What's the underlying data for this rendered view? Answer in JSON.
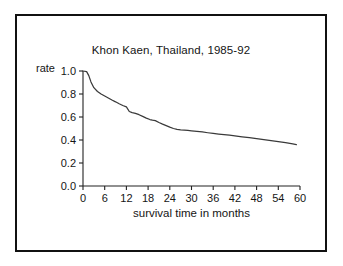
{
  "figure": {
    "border_color": "#111111",
    "background": "#ffffff"
  },
  "chart_data": {
    "type": "line",
    "title": "Khon Kaen, Thailand, 1985-92",
    "xlabel": "survival time in months",
    "ylabel": "rate",
    "xlim": [
      0,
      60
    ],
    "ylim": [
      0.0,
      1.0
    ],
    "grid": false,
    "legend": null,
    "line_color": "#3a3a3a",
    "xticks": [
      0,
      6,
      12,
      18,
      24,
      30,
      36,
      42,
      48,
      54,
      60
    ],
    "xtick_labels": [
      "0",
      "6",
      "12",
      "18",
      "24",
      "30",
      "36",
      "42",
      "48",
      "54",
      "60"
    ],
    "yticks": [
      0.0,
      0.2,
      0.4,
      0.6,
      0.8,
      1.0
    ],
    "ytick_labels": [
      "0.0",
      "0.2",
      "0.4",
      "0.6",
      "0.8",
      "1.0"
    ],
    "series": [
      {
        "name": "survival rate",
        "x": [
          0,
          1,
          1.6,
          2.2,
          3,
          4,
          5,
          6,
          7,
          8,
          9,
          10,
          11,
          12,
          12.8,
          13.6,
          14.5,
          15.5,
          16.5,
          17.5,
          18.5,
          19.2,
          20,
          21,
          22,
          23,
          24,
          25,
          26,
          27,
          28,
          29,
          30,
          31.5,
          33,
          34.5,
          36,
          37.5,
          39,
          40.5,
          42,
          44,
          46,
          48,
          50,
          52,
          54,
          56,
          58,
          59
        ],
        "y": [
          1.0,
          0.995,
          0.96,
          0.905,
          0.855,
          0.822,
          0.8,
          0.783,
          0.765,
          0.748,
          0.732,
          0.715,
          0.7,
          0.688,
          0.648,
          0.638,
          0.632,
          0.62,
          0.605,
          0.59,
          0.578,
          0.572,
          0.568,
          0.552,
          0.538,
          0.525,
          0.512,
          0.5,
          0.492,
          0.488,
          0.486,
          0.483,
          0.48,
          0.476,
          0.47,
          0.463,
          0.457,
          0.452,
          0.447,
          0.442,
          0.436,
          0.428,
          0.42,
          0.412,
          0.403,
          0.395,
          0.386,
          0.377,
          0.366,
          0.36
        ]
      }
    ]
  }
}
